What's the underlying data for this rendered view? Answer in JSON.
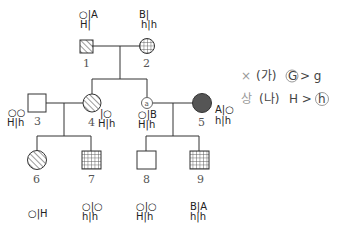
{
  "pedigree": {
    "individuals": [
      {
        "id": "1",
        "label": "1",
        "sex": "male",
        "fill": "hatched",
        "genotype_top": "○|A",
        "genotype_bottom": "H|"
      },
      {
        "id": "2",
        "label": "2",
        "sex": "female",
        "fill": "grid",
        "genotype_top": "B|",
        "genotype_bottom": "h|h"
      },
      {
        "id": "3",
        "label": "3",
        "sex": "male",
        "fill": "none",
        "genotype_top": "○○",
        "genotype_bottom": "H|h"
      },
      {
        "id": "4",
        "label": "4",
        "sex": "female",
        "fill": "hatched",
        "genotype_top": "|○",
        "genotype_bottom": "H|h"
      },
      {
        "id": "a",
        "label": "a",
        "sex": "female",
        "fill": "none",
        "genotype_top": "○|B",
        "genotype_bottom": "H|h"
      },
      {
        "id": "5",
        "label": "5",
        "sex": "female",
        "fill": "solid",
        "genotype_top": "A|○",
        "genotype_bottom": "h|h"
      },
      {
        "id": "6",
        "label": "6",
        "sex": "female",
        "fill": "hatched",
        "genotype": "○|H"
      },
      {
        "id": "7",
        "label": "7",
        "sex": "male",
        "fill": "grid",
        "genotype_top": "○|○",
        "genotype_bottom": "h|h"
      },
      {
        "id": "8",
        "label": "8",
        "sex": "male",
        "fill": "none",
        "genotype_top": "○|○",
        "genotype_bottom": "H|h"
      },
      {
        "id": "9",
        "label": "9",
        "sex": "male",
        "fill": "grid",
        "genotype_top": "B|A",
        "genotype_bottom": "h|h"
      }
    ],
    "colors": {
      "line": "#333333",
      "solid_fill": "#555555",
      "hatch": "#555555"
    }
  },
  "notes": {
    "line1_mark": "×",
    "line1_text": "(가)",
    "line1_circled": "G",
    "line1_rest": "> g",
    "line2_mark": "상",
    "line2_text": "(나)",
    "line2_rest": "H >",
    "line2_circled": "h"
  }
}
